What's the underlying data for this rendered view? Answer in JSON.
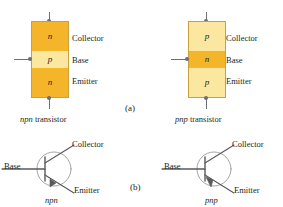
{
  "figure": {
    "top_cropped_text": "",
    "part_a_label": "(a)",
    "part_b_label": "(b)",
    "terminal_labels": {
      "collector": "Collector",
      "base": "Base",
      "emitter": "Emitter"
    },
    "colors": {
      "amber": "#f5b52a",
      "pale_yellow": "#fbe7a0",
      "block_border": "#c8a13c",
      "lead_gray": "#6d6e71",
      "text": "#231f20",
      "schematic_line": "#58595b"
    },
    "npn_block": {
      "caption_type": "npn",
      "caption_word": " transistor",
      "layers": [
        {
          "dopant": "n",
          "region": "Collector",
          "shade": "amber"
        },
        {
          "dopant": "p",
          "region": "Base",
          "shade": "pale"
        },
        {
          "dopant": "n",
          "region": "Emitter",
          "shade": "amber"
        }
      ]
    },
    "pnp_block": {
      "caption_type": "pnp",
      "caption_word": " transistor",
      "layers": [
        {
          "dopant": "p",
          "region": "Collector",
          "shade": "pale"
        },
        {
          "dopant": "n",
          "region": "Base",
          "shade": "amber"
        },
        {
          "dopant": "p",
          "region": "Emitter",
          "shade": "pale"
        }
      ]
    },
    "npn_symbol": {
      "name": "npn",
      "base_label": "Base",
      "collector_label": "Collector",
      "emitter_label": "Emitter",
      "arrow_direction": "outward-on-emitter"
    },
    "pnp_symbol": {
      "name": "pnp",
      "base_label": "Base",
      "collector_label": "Collector",
      "emitter_label": "Emitter",
      "arrow_direction": "inward-toward-base"
    }
  }
}
